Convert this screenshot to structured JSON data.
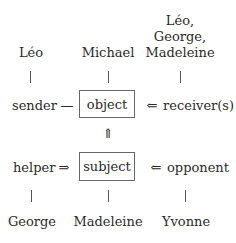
{
  "diagram": {
    "top_row": {
      "sender_actor": "Léo",
      "object_actor": "Michael",
      "receiver_actors": [
        "Léo,",
        "George,",
        "Madeleine"
      ]
    },
    "middle_row_1": {
      "sender": "sender",
      "sender_connector": "—",
      "object": "object",
      "receiver_arrow": "⇐",
      "receiver": "receiver(s)"
    },
    "vertical_arrow": "⇑",
    "middle_row_2": {
      "helper": "helper",
      "helper_arrow": "⇒",
      "subject": "subject",
      "opponent_arrow": "⇐",
      "opponent": "opponent"
    },
    "bottom_row": {
      "helper_actor": "George",
      "subject_actor": "Madeleine",
      "opponent_actor": "Yvonne"
    }
  }
}
